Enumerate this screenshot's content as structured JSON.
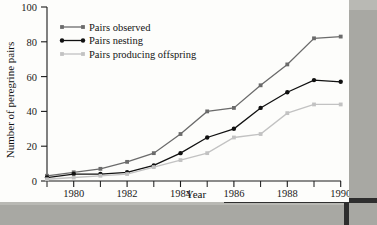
{
  "figure": {
    "title": "",
    "y_axis_label": "Number of peregrine pairs",
    "x_axis_label": "Year"
  },
  "legend": {
    "position": "top-left-inside",
    "items": [
      {
        "label": "Pairs observed",
        "color": "#6b6b6b",
        "marker": "square"
      },
      {
        "label": "Pairs nesting",
        "color": "#111111",
        "marker": "circle"
      },
      {
        "label": "Pairs producing offspring",
        "color": "#c2c2c2",
        "marker": "square"
      }
    ]
  },
  "axes": {
    "y_ticks": [
      "0",
      "20",
      "40",
      "60",
      "80",
      "100"
    ],
    "x_ticks": [
      "1980",
      "1982",
      "1984",
      "1986",
      "1988",
      "1990"
    ],
    "x_minor_ticks": [
      "1979",
      "1981",
      "1983",
      "1985",
      "1987",
      "1989"
    ]
  },
  "chart_data": {
    "type": "line",
    "title": "",
    "xlabel": "Year",
    "ylabel": "Number of peregrine pairs",
    "xlim": [
      1979,
      1990
    ],
    "ylim": [
      0,
      100
    ],
    "grid": false,
    "legend_position": "upper left (inside axes)",
    "x": [
      1979,
      1980,
      1981,
      1982,
      1983,
      1984,
      1985,
      1986,
      1987,
      1988,
      1989,
      1990
    ],
    "series": [
      {
        "name": "Pairs observed",
        "color": "#6b6b6b",
        "values": [
          3,
          5,
          7,
          11,
          16,
          27,
          40,
          42,
          55,
          67,
          82,
          83
        ]
      },
      {
        "name": "Pairs nesting",
        "color": "#111111",
        "values": [
          2,
          4,
          4,
          5,
          9,
          16,
          25,
          30,
          42,
          51,
          58,
          57
        ]
      },
      {
        "name": "Pairs producing offspring",
        "color": "#c2c2c2",
        "values": [
          1,
          2,
          3,
          4,
          8,
          12,
          16,
          25,
          27,
          39,
          44,
          44
        ]
      }
    ]
  }
}
